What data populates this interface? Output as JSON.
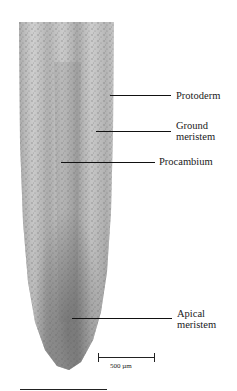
{
  "figure": {
    "labels": [
      {
        "id": "protoderm",
        "text": "Protoderm"
      },
      {
        "id": "ground-meristem",
        "line1": "Ground",
        "line2": "meristem"
      },
      {
        "id": "procambium",
        "text": "Procambium"
      },
      {
        "id": "apical-meristem",
        "line1": "Apical",
        "line2": "meristem"
      }
    ],
    "scale_bar": {
      "label": "500 µm"
    }
  }
}
